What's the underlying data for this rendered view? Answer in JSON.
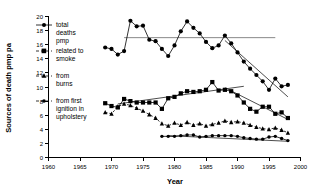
{
  "chart_data": {
    "type": "line",
    "title": "",
    "xlabel": "Year",
    "ylabel": "Sources of death pmp pa",
    "xlim": [
      1960,
      2000
    ],
    "ylim": [
      0,
      20
    ],
    "xticks": [
      1960,
      1965,
      1970,
      1975,
      1980,
      1985,
      1990,
      1995,
      2000
    ],
    "yticks": [
      0,
      2,
      4,
      6,
      8,
      10,
      12,
      14,
      16,
      18,
      20
    ],
    "grid": false,
    "legend_position": "left-inside",
    "annotations": [
      {
        "name": "reference-line",
        "type": "horizontal-line",
        "y": 17.0,
        "x_start": 1972,
        "x_end": 1996
      }
    ],
    "series": [
      {
        "name": "total deaths pmp",
        "marker": "circle",
        "linestyle": "solid",
        "x": [
          1969,
          1970,
          1971,
          1972,
          1973,
          1974,
          1975,
          1976,
          1977,
          1978,
          1979,
          1980,
          1981,
          1982,
          1983,
          1984,
          1985,
          1986,
          1987,
          1988,
          1989,
          1990,
          1991,
          1992,
          1993,
          1994,
          1995,
          1996,
          1997,
          1998
        ],
        "y": [
          15.6,
          15.4,
          14.6,
          15.1,
          19.4,
          18.6,
          18.7,
          16.7,
          16.5,
          15.4,
          14.4,
          15.9,
          17.9,
          19.3,
          18.4,
          17.6,
          16.4,
          15.5,
          15.9,
          17.3,
          16.2,
          14.9,
          13.6,
          12.6,
          11.7,
          10.8,
          9.6,
          11.2,
          10.1,
          10.3
        ]
      },
      {
        "name": "related to smoke",
        "marker": "square",
        "linestyle": "solid",
        "x": [
          1969,
          1970,
          1971,
          1972,
          1973,
          1974,
          1975,
          1976,
          1977,
          1978,
          1979,
          1980,
          1981,
          1982,
          1983,
          1984,
          1985,
          1986,
          1987,
          1988,
          1989,
          1990,
          1991,
          1992,
          1993,
          1994,
          1995,
          1996,
          1997,
          1998
        ],
        "y": [
          7.7,
          7.3,
          7.1,
          8.3,
          8.0,
          7.8,
          7.8,
          7.8,
          7.8,
          6.9,
          8.4,
          8.6,
          9.1,
          9.4,
          9.3,
          9.4,
          9.6,
          10.7,
          9.5,
          9.6,
          9.4,
          8.8,
          7.8,
          6.9,
          6.5,
          7.2,
          7.2,
          6.2,
          6.4,
          5.6
        ]
      },
      {
        "name": "from burns",
        "marker": "triangle",
        "linestyle": "dashed",
        "x": [
          1969,
          1970,
          1971,
          1972,
          1973,
          1974,
          1975,
          1976,
          1977,
          1978,
          1979,
          1980,
          1981,
          1982,
          1983,
          1984,
          1985,
          1986,
          1987,
          1988,
          1989,
          1990,
          1991,
          1992,
          1993,
          1994,
          1995,
          1996,
          1997,
          1998
        ],
        "y": [
          6.4,
          6.2,
          7.2,
          7.6,
          7.4,
          7.0,
          6.6,
          6.1,
          5.6,
          4.8,
          4.5,
          4.9,
          4.6,
          5.0,
          4.6,
          4.8,
          4.5,
          4.7,
          4.9,
          5.2,
          5.0,
          5.1,
          4.9,
          4.6,
          4.3,
          4.1,
          4.0,
          4.2,
          3.9,
          3.5
        ]
      },
      {
        "name": "from first ignition in upholstery",
        "marker": "circle-small",
        "linestyle": "solid",
        "x": [
          1978,
          1979,
          1980,
          1981,
          1982,
          1983,
          1984,
          1985,
          1986,
          1987,
          1988,
          1989,
          1990,
          1991,
          1992,
          1993,
          1994,
          1995,
          1996,
          1997,
          1998
        ],
        "y": [
          3.0,
          3.0,
          3.0,
          3.1,
          3.2,
          3.2,
          2.9,
          3.0,
          3.1,
          3.1,
          3.1,
          3.1,
          3.0,
          2.8,
          2.7,
          2.6,
          2.6,
          2.9,
          3.0,
          2.7,
          2.4
        ]
      }
    ],
    "trend_lines": [
      {
        "name": "smoke-rise-trend",
        "x": [
          1971,
          1991
        ],
        "y": [
          7.6,
          10.1
        ]
      },
      {
        "name": "total-decline-trend",
        "x": [
          1988,
          1998
        ],
        "y": [
          16.6,
          8.6
        ]
      },
      {
        "name": "smoke-decline-trend",
        "x": [
          1988,
          1998
        ],
        "y": [
          9.9,
          5.4
        ]
      },
      {
        "name": "upholstery-trend",
        "x": [
          1979,
          1998
        ],
        "y": [
          3.1,
          2.3
        ]
      }
    ],
    "legend": [
      {
        "label": "total deaths pmp",
        "marker": "circle",
        "linestyle": "solid"
      },
      {
        "label": "related to smoke",
        "marker": "square",
        "linestyle": "dashed"
      },
      {
        "label": "from burns",
        "marker": "triangle",
        "linestyle": "dashed"
      },
      {
        "label": "from first ignition in upholstery",
        "marker": "circle-small",
        "linestyle": "dashed"
      }
    ]
  },
  "legend_lines": {
    "e0_l0": "total",
    "e0_l1": "deaths",
    "e0_l2": "pmp",
    "e1_l0": "related to",
    "e1_l1": "smoke",
    "e2_l0": "from",
    "e2_l1": "burns",
    "e3_l0": "from first",
    "e3_l1": "ignition in",
    "e3_l2": "upholstery"
  },
  "ticks": {
    "y20": "20",
    "y18": "18",
    "y16": "16",
    "y14": "14",
    "y12": "12",
    "y10": "10",
    "y8": "8",
    "y6": "6",
    "y4": "4",
    "y2": "2",
    "y0": "0",
    "x1960": "1960",
    "x1965": "1965",
    "x1970": "1970",
    "x1975": "1975",
    "x1980": "1980",
    "x1985": "1985",
    "x1990": "1990",
    "x1995": "1995",
    "x2000": "2000"
  },
  "labels": {
    "xlabel": "Year",
    "ylabel": "Sources of death pmp pa"
  }
}
